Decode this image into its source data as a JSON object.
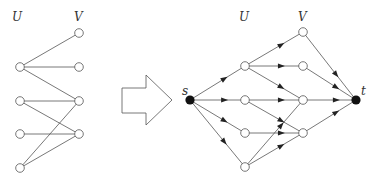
{
  "left_graph": {
    "labels": {
      "U": "U",
      "V": "V"
    },
    "U": [
      {
        "id": "u1",
        "x": 20,
        "y": 67
      },
      {
        "id": "u2",
        "x": 20,
        "y": 101
      },
      {
        "id": "u3",
        "x": 20,
        "y": 134
      },
      {
        "id": "u4",
        "x": 20,
        "y": 168
      }
    ],
    "V": [
      {
        "id": "v1",
        "x": 79,
        "y": 33
      },
      {
        "id": "v2",
        "x": 79,
        "y": 67
      },
      {
        "id": "v3",
        "x": 79,
        "y": 101
      },
      {
        "id": "v4",
        "x": 79,
        "y": 134
      }
    ],
    "edges": [
      [
        "u1",
        "v1"
      ],
      [
        "u1",
        "v2"
      ],
      [
        "u1",
        "v3"
      ],
      [
        "u2",
        "v3"
      ],
      [
        "u2",
        "v4"
      ],
      [
        "u3",
        "v4"
      ],
      [
        "u4",
        "v3"
      ],
      [
        "u4",
        "v4"
      ]
    ]
  },
  "transform_arrow": {
    "direction": "right"
  },
  "right_graph": {
    "labels": {
      "U": "U",
      "V": "V",
      "s": "s",
      "t": "t"
    },
    "source": {
      "id": "s",
      "x": 190,
      "y": 100
    },
    "sink": {
      "id": "t",
      "x": 356,
      "y": 100
    },
    "U": [
      {
        "id": "u1",
        "x": 245,
        "y": 66
      },
      {
        "id": "u2",
        "x": 245,
        "y": 100
      },
      {
        "id": "u3",
        "x": 245,
        "y": 133
      },
      {
        "id": "u4",
        "x": 245,
        "y": 167
      }
    ],
    "V": [
      {
        "id": "v1",
        "x": 303,
        "y": 32
      },
      {
        "id": "v2",
        "x": 303,
        "y": 66
      },
      {
        "id": "v3",
        "x": 303,
        "y": 100
      },
      {
        "id": "v4",
        "x": 303,
        "y": 133
      }
    ],
    "edges": [
      [
        "s",
        "u1"
      ],
      [
        "s",
        "u2"
      ],
      [
        "s",
        "u3"
      ],
      [
        "s",
        "u4"
      ],
      [
        "u1",
        "v1"
      ],
      [
        "u1",
        "v2"
      ],
      [
        "u1",
        "v3"
      ],
      [
        "u2",
        "v3"
      ],
      [
        "u2",
        "v4"
      ],
      [
        "u3",
        "v4"
      ],
      [
        "u4",
        "v3"
      ],
      [
        "u4",
        "v4"
      ],
      [
        "v1",
        "t"
      ],
      [
        "v2",
        "t"
      ],
      [
        "v3",
        "t"
      ],
      [
        "v4",
        "t"
      ]
    ],
    "directed": true
  },
  "colors": {
    "line": "#555555",
    "node_fill": "#ffffff",
    "terminal_fill": "#111111"
  }
}
